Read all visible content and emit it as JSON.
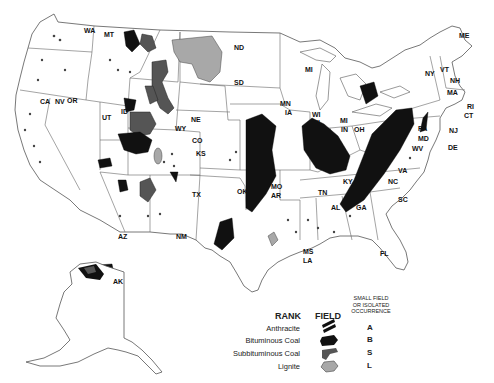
{
  "map": {
    "title": "Coal fields of the United States",
    "states": [
      {
        "code": "WA",
        "x": 84,
        "y": 27
      },
      {
        "code": "MT",
        "x": 104,
        "y": 31
      },
      {
        "code": "ND",
        "x": 234,
        "y": 44
      },
      {
        "code": "SD",
        "x": 234,
        "y": 79
      },
      {
        "code": "OR",
        "x": 67,
        "y": 97
      },
      {
        "code": "CA",
        "x": 40,
        "y": 98
      },
      {
        "code": "NV",
        "x": 55,
        "y": 98
      },
      {
        "code": "ID",
        "x": 121,
        "y": 108
      },
      {
        "code": "UT",
        "x": 102,
        "y": 114
      },
      {
        "code": "WY",
        "x": 175,
        "y": 125
      },
      {
        "code": "NE",
        "x": 191,
        "y": 116
      },
      {
        "code": "CO",
        "x": 192,
        "y": 137
      },
      {
        "code": "KS",
        "x": 196,
        "y": 150
      },
      {
        "code": "OK",
        "x": 237,
        "y": 188
      },
      {
        "code": "TX",
        "x": 192,
        "y": 191
      },
      {
        "code": "AZ",
        "x": 118,
        "y": 233
      },
      {
        "code": "NM",
        "x": 176,
        "y": 233
      },
      {
        "code": "AK",
        "x": 113,
        "y": 278
      },
      {
        "code": "MN",
        "x": 280,
        "y": 100
      },
      {
        "code": "IA",
        "x": 285,
        "y": 109
      },
      {
        "code": "WI",
        "x": 312,
        "y": 111
      },
      {
        "code": "IL",
        "x": 316,
        "y": 119
      },
      {
        "code": "MI",
        "x": 305,
        "y": 66
      },
      {
        "code": "MI",
        "x": 340,
        "y": 117
      },
      {
        "code": "IN",
        "x": 341,
        "y": 126
      },
      {
        "code": "OH",
        "x": 354,
        "y": 126
      },
      {
        "code": "KY",
        "x": 343,
        "y": 178
      },
      {
        "code": "MO",
        "x": 271,
        "y": 183
      },
      {
        "code": "AR",
        "x": 271,
        "y": 192
      },
      {
        "code": "TN",
        "x": 318,
        "y": 189
      },
      {
        "code": "AL",
        "x": 331,
        "y": 204
      },
      {
        "code": "GA",
        "x": 356,
        "y": 204
      },
      {
        "code": "MS",
        "x": 303,
        "y": 248
      },
      {
        "code": "LA",
        "x": 303,
        "y": 257
      },
      {
        "code": "FL",
        "x": 380,
        "y": 250
      },
      {
        "code": "SC",
        "x": 398,
        "y": 196
      },
      {
        "code": "NC",
        "x": 388,
        "y": 178
      },
      {
        "code": "VA",
        "x": 398,
        "y": 167
      },
      {
        "code": "WV",
        "x": 412,
        "y": 145
      },
      {
        "code": "MD",
        "x": 418,
        "y": 135
      },
      {
        "code": "PA",
        "x": 418,
        "y": 125
      },
      {
        "code": "NY",
        "x": 425,
        "y": 70
      },
      {
        "code": "VT",
        "x": 440,
        "y": 66
      },
      {
        "code": "NH",
        "x": 450,
        "y": 77
      },
      {
        "code": "MA",
        "x": 447,
        "y": 89
      },
      {
        "code": "RI",
        "x": 467,
        "y": 103
      },
      {
        "code": "CT",
        "x": 464,
        "y": 112
      },
      {
        "code": "NJ",
        "x": 449,
        "y": 127
      },
      {
        "code": "DE",
        "x": 448,
        "y": 144
      },
      {
        "code": "ME",
        "x": 459,
        "y": 32
      }
    ]
  },
  "legend": {
    "rank_header": "RANK",
    "field_header": "FIELD",
    "small_header": [
      "SMALL FIELD",
      "OR ISOLATED",
      "OCCURRENCE"
    ],
    "items": [
      {
        "rank": "Anthracite",
        "code": "A",
        "color": "#111111"
      },
      {
        "rank": "Bituminous Coal",
        "code": "B",
        "color": "#111111"
      },
      {
        "rank": "Subbituminous Coal",
        "code": "S",
        "color": "#555555"
      },
      {
        "rank": "Lignite",
        "code": "L",
        "color": "#aaaaaa"
      }
    ]
  },
  "colors": {
    "bituminous": "#111111",
    "subbituminous": "#555555",
    "lignite": "#a8a8a8",
    "border": "#555555"
  }
}
